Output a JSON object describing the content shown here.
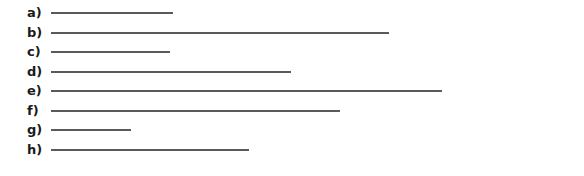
{
  "worksheet": {
    "items": [
      {
        "label": "a)",
        "line_end": 173
      },
      {
        "label": "b)",
        "line_end": 389
      },
      {
        "label": "c)",
        "line_end": 170
      },
      {
        "label": "d)",
        "line_end": 291
      },
      {
        "label": "e)",
        "line_end": 442
      },
      {
        "label": "f)",
        "line_end": 340
      },
      {
        "label": "g)",
        "line_end": 131
      },
      {
        "label": "h)",
        "line_end": 249
      }
    ],
    "line_color": "#5a5a5a"
  }
}
